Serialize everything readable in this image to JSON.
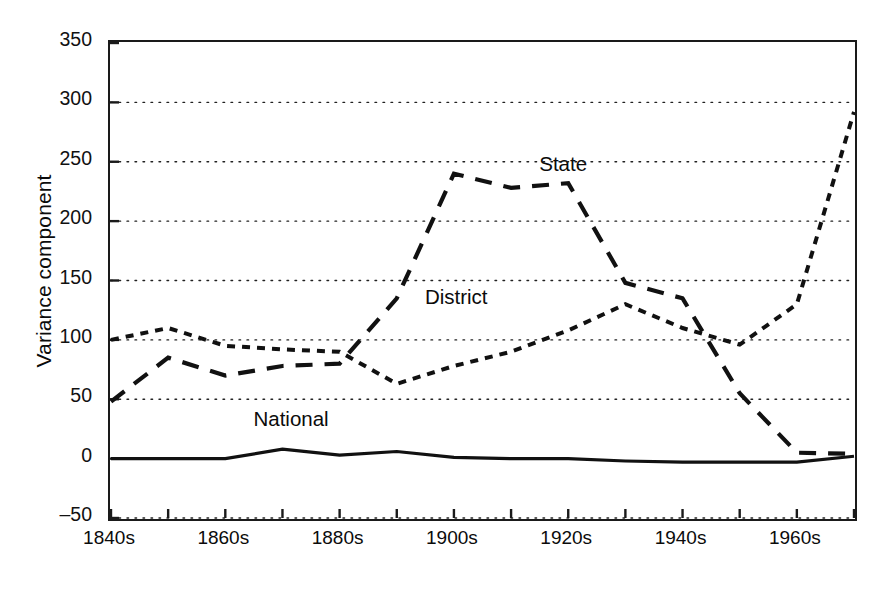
{
  "chart_data": {
    "type": "line",
    "title": "",
    "xlabel": "",
    "ylabel": "Variance component",
    "x": [
      "1840s",
      "1850s",
      "1860s",
      "1870s",
      "1880s",
      "1890s",
      "1900s",
      "1910s",
      "1920s",
      "1930s",
      "1940s",
      "1950s",
      "1960s",
      "1970s"
    ],
    "xtick_labels_shown": [
      "1840s",
      "1860s",
      "1880s",
      "1900s",
      "1920s",
      "1940s",
      "1960s"
    ],
    "ytick_labels": [
      "-50",
      "0",
      "50",
      "100",
      "150",
      "200",
      "250",
      "300",
      "350"
    ],
    "ylim": [
      -50,
      350
    ],
    "ytick_step": 50,
    "grid": "horizontal-dotted",
    "legend": "inline-annotations",
    "series": [
      {
        "name": "State",
        "style": "long-dashed",
        "color": "#111111",
        "values": [
          48,
          85,
          70,
          78,
          80,
          135,
          240,
          228,
          232,
          148,
          135,
          55,
          5,
          4
        ]
      },
      {
        "name": "District",
        "style": "short-dashed",
        "color": "#111111",
        "values": [
          100,
          110,
          95,
          92,
          90,
          63,
          78,
          90,
          108,
          130,
          110,
          96,
          130,
          292
        ]
      },
      {
        "name": "National",
        "style": "solid",
        "color": "#111111",
        "values": [
          0,
          0,
          0,
          8,
          3,
          6,
          1,
          0,
          0,
          -2,
          -3,
          -3,
          -3,
          2
        ]
      }
    ],
    "annotations": [
      {
        "text": "State",
        "x": "1920s",
        "y": 245
      },
      {
        "text": "District",
        "x": "1900s",
        "y": 133
      },
      {
        "text": "National",
        "x": "1870s",
        "y": 30
      }
    ]
  },
  "axes": {
    "y_title": "Variance component"
  }
}
